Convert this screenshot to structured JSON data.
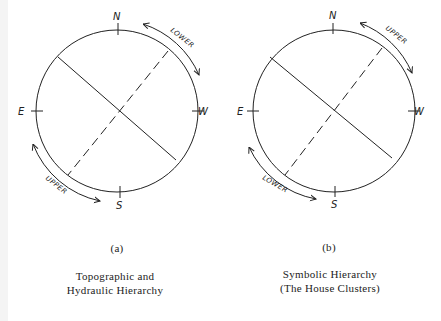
{
  "panels": [
    {
      "id": "a",
      "label": "(a)",
      "caption_line1": "Topographic and",
      "caption_line2": "Hydraulic Hierarchy",
      "directions": {
        "n": "N",
        "s": "S",
        "e": "E",
        "w": "W"
      },
      "arc_top_label": "LOWER",
      "arc_bottom_label": "UPPER"
    },
    {
      "id": "b",
      "label": "(b)",
      "caption_line1": "Symbolic Hierarchy",
      "caption_line2": "(The House Clusters)",
      "directions": {
        "n": "N",
        "s": "S",
        "e": "E",
        "w": "W"
      },
      "arc_top_label": "UPPER",
      "arc_bottom_label": "LOWER"
    }
  ],
  "colors": {
    "stroke": "#222222",
    "background": "#ffffff"
  }
}
